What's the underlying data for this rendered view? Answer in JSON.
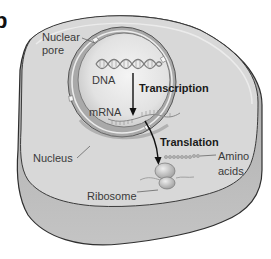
{
  "figure": {
    "panel_letter": "b",
    "colors": {
      "background": "#ffffff",
      "cytoplasm": "#d6d6d6",
      "cell_slab": "#b3b3b3",
      "outline": "#3a3a3a",
      "nucleus_interior": "#e6e6e6",
      "nuclear_envelope": "#a8a8a8",
      "arrow": "#111111",
      "label_text": "#3a3a3a"
    }
  },
  "labels": {
    "nuclear_pore_line1": "Nuclear",
    "nuclear_pore_line2": "pore",
    "dna": "DNA",
    "transcription": "Transcription",
    "mrna": "mRNA",
    "translation": "Translation",
    "amino_line1": "Amino",
    "amino_line2": "acids",
    "nucleus": "Nucleus",
    "ribosome": "Ribosome"
  },
  "structures": [
    {
      "name": "cell",
      "description": "Outer cell membrane with cytoplasm, drawn as 3D slab"
    },
    {
      "name": "nucleus",
      "description": "Double-membrane nuclear envelope with nuclear pores"
    },
    {
      "name": "nuclear-pore",
      "description": "Gap in nuclear envelope"
    },
    {
      "name": "dna",
      "description": "Double helix inside nucleus"
    },
    {
      "name": "mrna",
      "description": "Single wavy strand exiting nucleus"
    },
    {
      "name": "ribosome",
      "description": "Blob in cytoplasm on mRNA"
    },
    {
      "name": "amino-acids",
      "description": "Beaded chain emerging from ribosome"
    }
  ],
  "processes": [
    {
      "name": "Transcription",
      "from": "DNA",
      "to": "mRNA"
    },
    {
      "name": "Translation",
      "from": "mRNA",
      "to": "Amino acids (protein) at ribosome"
    }
  ]
}
